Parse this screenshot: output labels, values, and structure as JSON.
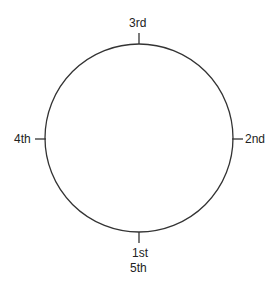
{
  "diagram": {
    "type": "circle-positions",
    "circle": {
      "cx": 139,
      "cy": 138,
      "r": 94,
      "stroke": "#333333"
    },
    "labels": {
      "top": "3rd",
      "right": "2nd",
      "left": "4th",
      "bottom_1": "1st",
      "bottom_2": "5th"
    }
  }
}
